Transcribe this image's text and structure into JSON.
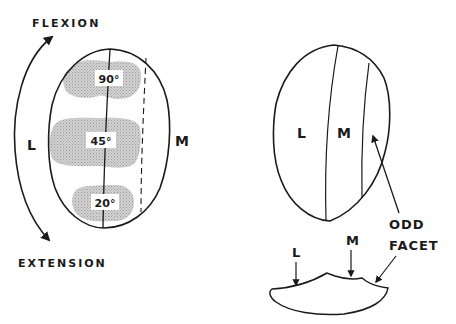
{
  "figure": {
    "left_view": {
      "labels": {
        "flexion": "FLEXION",
        "extension": "EXTENSION",
        "lateral": "L",
        "medial": "M"
      },
      "contact_zones": [
        {
          "angle_label": "90°",
          "position": "top"
        },
        {
          "angle_label": "45°",
          "position": "middle"
        },
        {
          "angle_label": "20°",
          "position": "bottom"
        }
      ]
    },
    "right_view": {
      "labels": {
        "lateral": "L",
        "medial": "M",
        "odd_facet_line1": "ODD",
        "odd_facet_line2": "FACET"
      },
      "cross_section_labels": {
        "lateral": "L",
        "medial": "M"
      }
    },
    "colors": {
      "line": "#1a1a1a",
      "shading": "#c8c8c8",
      "background": "#ffffff"
    }
  }
}
